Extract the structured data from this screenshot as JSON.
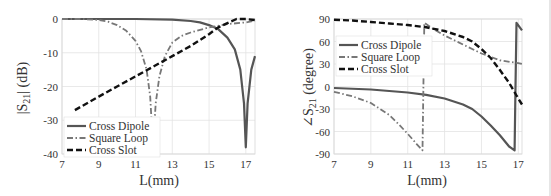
{
  "chart_data": [
    {
      "type": "line",
      "id": "magnitude",
      "title": "",
      "xlabel": "L(mm)",
      "ylabel": "|S21| (dB)",
      "xlim": [
        7,
        17.5
      ],
      "ylim": [
        -40,
        0
      ],
      "xticks": [
        7,
        9,
        11,
        13,
        15,
        17
      ],
      "yticks": [
        0,
        -10,
        -20,
        -30,
        -40
      ],
      "grid": true,
      "legend_position": "lower left",
      "series": [
        {
          "name": "Cross Dipole",
          "style": "solid",
          "color": "#555555",
          "x": [
            7,
            9,
            11,
            13,
            14,
            14.5,
            15,
            15.5,
            16,
            16.4,
            16.7,
            16.9,
            17.0,
            17.1,
            17.3,
            17.5
          ],
          "y": [
            0,
            0,
            0,
            -0.2,
            -0.6,
            -1.0,
            -1.8,
            -3.0,
            -5.5,
            -9,
            -15,
            -25,
            -38,
            -25,
            -15,
            -11
          ]
        },
        {
          "name": "Square Loop",
          "style": "dashdot",
          "color": "#777777",
          "x": [
            7,
            8,
            9,
            9.5,
            10,
            10.5,
            11,
            11.3,
            11.6,
            11.8,
            11.95,
            12.1,
            12.3,
            12.6,
            13,
            13.5,
            14,
            15,
            16,
            17,
            17.5
          ],
          "y": [
            0,
            0,
            -0.3,
            -0.8,
            -1.8,
            -3.5,
            -6.5,
            -9.5,
            -15,
            -23,
            -38,
            -25,
            -17,
            -11,
            -7,
            -5,
            -4,
            -2.5,
            -1.5,
            -1,
            -0.5
          ]
        },
        {
          "name": "Cross Slot",
          "style": "dashed",
          "color": "#111111",
          "x": [
            7.7,
            9,
            10,
            11,
            12,
            13,
            14,
            15,
            15.5,
            16,
            16.5,
            17,
            17.5
          ],
          "y": [
            -27,
            -23,
            -20,
            -17,
            -14,
            -11,
            -8,
            -4.5,
            -2.5,
            -1.2,
            0,
            0,
            -0.3
          ]
        }
      ]
    },
    {
      "type": "line",
      "id": "phase",
      "title": "",
      "xlabel": "L(mm)",
      "ylabel": "∠S21 (degree)",
      "xlim": [
        7,
        17.2
      ],
      "ylim": [
        -90,
        90
      ],
      "xticks": [
        7,
        9,
        11,
        13,
        15,
        17
      ],
      "yticks": [
        90,
        60,
        30,
        0,
        -30,
        -60,
        -90
      ],
      "grid": true,
      "legend_position": "upper left",
      "series": [
        {
          "name": "Cross Dipole",
          "style": "solid",
          "color": "#555555",
          "x": [
            7,
            9,
            11,
            12,
            13,
            14,
            14.5,
            15,
            15.5,
            16,
            16.5,
            16.8,
            16.85,
            16.9,
            17.2
          ],
          "y": [
            -2,
            -4,
            -8,
            -11,
            -16,
            -24,
            -30,
            -40,
            -52,
            -65,
            -80,
            -85,
            0,
            85,
            75
          ]
        },
        {
          "name": "Square Loop",
          "style": "dashdot",
          "color": "#777777",
          "x": [
            7,
            8,
            9,
            10,
            10.5,
            11,
            11.5,
            11.8,
            11.85,
            11.9,
            12.3,
            13,
            14,
            15,
            16,
            17,
            17.2
          ],
          "y": [
            -7,
            -13,
            -22,
            -38,
            -50,
            -63,
            -77,
            -85,
            0,
            85,
            78,
            68,
            56,
            44,
            35,
            31,
            30
          ]
        },
        {
          "name": "Cross Slot",
          "style": "dashed",
          "color": "#111111",
          "x": [
            7,
            8,
            9,
            10,
            11,
            12,
            13,
            14,
            14.5,
            15,
            15.5,
            16,
            16.5,
            16.9,
            17.2
          ],
          "y": [
            89,
            88,
            86,
            84,
            82,
            79,
            74,
            66,
            60,
            50,
            38,
            22,
            5,
            -12,
            -24
          ]
        }
      ]
    }
  ],
  "legend": {
    "items": [
      "Cross Dipole",
      "Square Loop",
      "Cross Slot"
    ]
  },
  "labels": {
    "left_x": "L(mm)",
    "left_y_main": "|S",
    "left_y_sub": "21",
    "left_y_rest": "| (dB)",
    "right_x": "L(mm)",
    "right_y_main": "∠S",
    "right_y_sub": "21",
    "right_y_rest": " (degree)"
  }
}
